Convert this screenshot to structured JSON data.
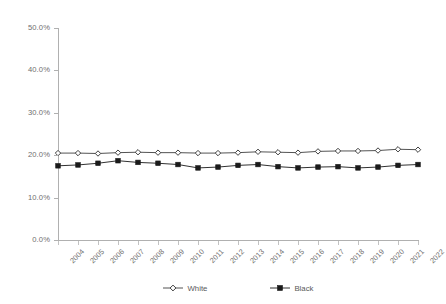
{
  "chart_data": {
    "type": "line",
    "title": "",
    "subtitle": "",
    "xlabel": "",
    "ylabel": "",
    "grid": false,
    "legend_position": "bottom-center",
    "categories": [
      "2004",
      "2005",
      "2006",
      "2007",
      "2008",
      "2009",
      "2010",
      "2011",
      "2012",
      "2013",
      "2014",
      "2015",
      "2016",
      "2017",
      "2018",
      "2019",
      "2020",
      "2021",
      "2022"
    ],
    "x": [
      2004,
      2005,
      2006,
      2007,
      2008,
      2009,
      2010,
      2011,
      2012,
      2013,
      2014,
      2015,
      2016,
      2017,
      2018,
      2019,
      2020,
      2021,
      2022
    ],
    "xlim": [
      2004,
      2022
    ],
    "ylim": [
      0.0,
      50.0
    ],
    "yticks": [
      0.0,
      10.0,
      20.0,
      30.0,
      40.0,
      50.0
    ],
    "ytick_labels": [
      "0.0%",
      "10.0%",
      "20.0%",
      "30.0%",
      "40.0%",
      "50.0%"
    ],
    "value_format": "percent",
    "series": [
      {
        "name": "White",
        "marker": "open-diamond",
        "color": "#404040",
        "values": [
          20.5,
          20.5,
          20.4,
          20.6,
          20.7,
          20.6,
          20.6,
          20.5,
          20.5,
          20.6,
          20.8,
          20.7,
          20.6,
          20.9,
          21.0,
          21.0,
          21.1,
          21.4,
          21.3
        ]
      },
      {
        "name": "Black",
        "marker": "filled-square",
        "color": "#1a1a1a",
        "values": [
          17.5,
          17.7,
          18.1,
          18.7,
          18.3,
          18.1,
          17.8,
          17.0,
          17.2,
          17.6,
          17.8,
          17.3,
          17.0,
          17.2,
          17.3,
          17.0,
          17.2,
          17.6,
          17.8
        ]
      }
    ]
  },
  "legend": {
    "items": [
      {
        "label": "White"
      },
      {
        "label": "Black"
      }
    ]
  }
}
